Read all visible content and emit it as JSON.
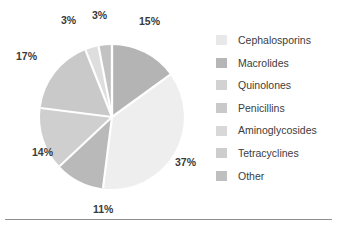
{
  "chart_data": {
    "type": "pie",
    "title": "",
    "subtitle": "",
    "xlabel": "",
    "ylabel": "",
    "legend_position": "right",
    "grid": false,
    "start_angle_deg": 0,
    "direction": "clockwise",
    "categories": [
      "Cephalosporins",
      "Macrolides",
      "Quinolones",
      "Penicillins",
      "Aminoglycosides",
      "Tetracyclines",
      "Other"
    ],
    "values": [
      15,
      37,
      11,
      14,
      17,
      3,
      3
    ],
    "data_labels": [
      "15%",
      "37%",
      "11%",
      "14%",
      "17%",
      "3%",
      "3%"
    ],
    "colors": [
      "#b4b4b4",
      "#eeeeee",
      "#b9b9b9",
      "#cfcfcf",
      "#c9c9c9",
      "#dedede",
      "#c2c2c2"
    ],
    "slices": [
      {
        "label": "Cephalosporins",
        "value": 15,
        "data_label": "15%",
        "color": "#b4b4b4"
      },
      {
        "label": "Macrolides",
        "value": 37,
        "data_label": "37%",
        "color": "#eeeeee"
      },
      {
        "label": "Quinolones",
        "value": 11,
        "data_label": "11%",
        "color": "#b9b9b9"
      },
      {
        "label": "Penicillins",
        "value": 14,
        "data_label": "14%",
        "color": "#cfcfcf"
      },
      {
        "label": "Aminoglycosides",
        "value": 17,
        "data_label": "17%",
        "color": "#c9c9c9"
      },
      {
        "label": "Tetracyclines",
        "value": 3,
        "data_label": "3%",
        "color": "#dedede"
      },
      {
        "label": "Other",
        "value": 3,
        "data_label": "3%",
        "color": "#c2c2c2"
      }
    ]
  },
  "pie": {
    "center_x": 112,
    "center_y": 117,
    "radius": 72,
    "separator_color": "#ffffff",
    "labels": [
      {
        "text": "15%",
        "x": 139,
        "y": 15
      },
      {
        "text": "37%",
        "x": 175,
        "y": 156
      },
      {
        "text": "11%",
        "x": 93,
        "y": 203
      },
      {
        "text": "14%",
        "x": 32,
        "y": 146
      },
      {
        "text": "17%",
        "x": 16,
        "y": 50
      },
      {
        "text": "3%",
        "x": 61,
        "y": 14
      },
      {
        "text": "3%",
        "x": 92,
        "y": 9
      }
    ]
  },
  "legend": {
    "items": [
      {
        "label": "Cephalosporins",
        "color": "#e8e8e8"
      },
      {
        "label": "Macrolides",
        "color": "#b6b6b6"
      },
      {
        "label": "Quinolones",
        "color": "#d2d2d2"
      },
      {
        "label": "Penicillins",
        "color": "#c9c9c9"
      },
      {
        "label": "Aminoglycosides",
        "color": "#d8d8d8"
      },
      {
        "label": "Tetracyclines",
        "color": "#cdcdcd"
      },
      {
        "label": "Other",
        "color": "#bfbfbf"
      }
    ]
  }
}
